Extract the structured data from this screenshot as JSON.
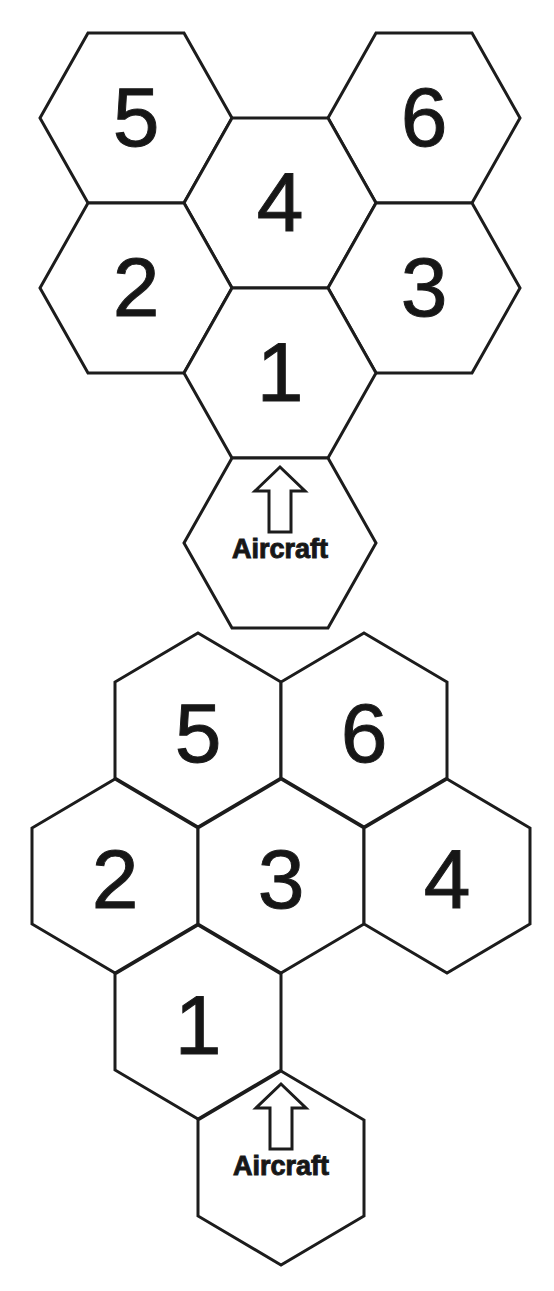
{
  "figure": {
    "background_color": "#ffffff",
    "line_color": "#1c1c1c",
    "text_color": "#161616",
    "diagrams": [
      {
        "name": "flat-top-hex-pattern",
        "cells": [
          {
            "label": "5"
          },
          {
            "label": "6"
          },
          {
            "label": "4"
          },
          {
            "label": "2"
          },
          {
            "label": "3"
          },
          {
            "label": "1"
          }
        ],
        "aircraft_cell": {
          "label": "Aircraft",
          "icon": "up-arrow-icon"
        }
      },
      {
        "name": "pointy-top-hex-pattern",
        "cells": [
          {
            "label": "5"
          },
          {
            "label": "6"
          },
          {
            "label": "2"
          },
          {
            "label": "3"
          },
          {
            "label": "4"
          },
          {
            "label": "1"
          }
        ],
        "aircraft_cell": {
          "label": "Aircraft",
          "icon": "up-arrow-icon"
        }
      }
    ]
  }
}
